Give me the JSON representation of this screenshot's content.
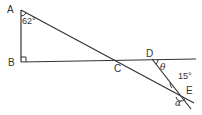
{
  "diagram": {
    "points": {
      "A": {
        "label": "A",
        "x": 21,
        "y": 10
      },
      "B": {
        "label": "B",
        "x": 21,
        "y": 62
      },
      "C": {
        "label": "C",
        "x": 116,
        "y": 61
      },
      "D": {
        "label": "D",
        "x": 152,
        "y": 59
      },
      "E": {
        "label": "E",
        "x": 180,
        "y": 95
      }
    },
    "angles": {
      "A": "62°",
      "theta": "θ",
      "E_small": "15°",
      "alpha": "α"
    },
    "colors": {
      "line": "#333333",
      "background": "#ffffff"
    }
  }
}
